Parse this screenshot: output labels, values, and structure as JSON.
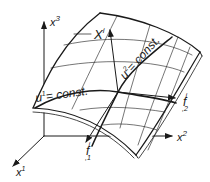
{
  "diagram": {
    "title": "",
    "colors": {
      "ink": "#1a1a1a",
      "background": "#ffffff"
    },
    "axes": {
      "x1": {
        "base": "x",
        "sup": "1"
      },
      "x2": {
        "base": "x",
        "sup": "2"
      },
      "x3": {
        "base": "x",
        "sup": "3"
      }
    },
    "position_vector": {
      "base": "X",
      "sup": "i"
    },
    "parameter_lines": {
      "u1": {
        "text": "u",
        "sup": "1",
        "rest": "= const."
      },
      "u2": {
        "text": "u",
        "sup": "2",
        "rest": "= const."
      }
    },
    "tangent_vectors": {
      "f1": {
        "base": "f",
        "sup": "i",
        "sub": ",1"
      },
      "f2": {
        "base": "f",
        "sup": "i",
        "sub": ",2"
      }
    }
  }
}
